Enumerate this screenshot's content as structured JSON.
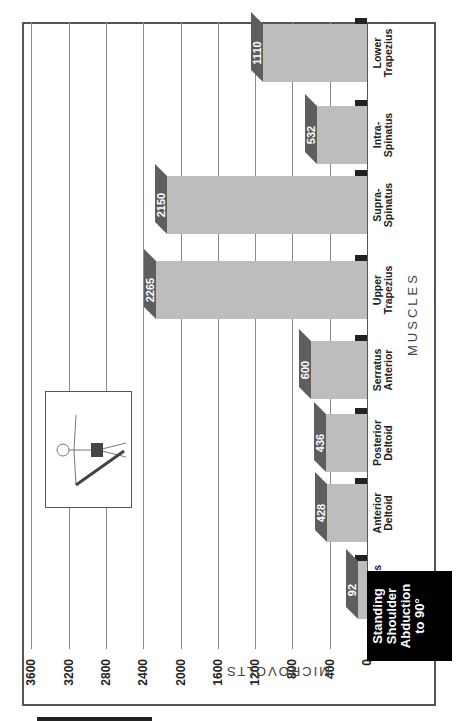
{
  "chart_data": {
    "type": "bar",
    "title": "Standing Shoulder Abduction to 90°",
    "xlabel": "MUSCLES",
    "ylabel": "MICROVOLTS",
    "categories": [
      "Pectoralis Major",
      "Anterior Deltoid",
      "Posterior Deltoid",
      "Serratus Anterior",
      "Upper Trapezius",
      "Supra-Spinatus",
      "Intra-Spinatus",
      "Lower Trapezius"
    ],
    "values": [
      92,
      428,
      436,
      600,
      2265,
      2150,
      532,
      1110
    ],
    "ylim": [
      0,
      3600
    ],
    "yticks": [
      0,
      400,
      800,
      1200,
      1600,
      2000,
      2400,
      2800,
      3200,
      3600
    ],
    "grid": true,
    "style": "3d-bar",
    "orientation": "rotated-90"
  },
  "caption": {
    "lines": [
      "Standing",
      "Shoulder",
      "Abduction",
      "to 90°"
    ]
  },
  "axis": {
    "ylabel": "MICROVOLTS",
    "xlabel": "MUSCLES",
    "ticks": [
      "0",
      "400",
      "800",
      "1200",
      "1600",
      "2000",
      "2400",
      "2800",
      "3200",
      "3600"
    ]
  },
  "bars": [
    {
      "line1": "Pectoralis",
      "line2": "Major",
      "value": "92"
    },
    {
      "line1": "Anterior",
      "line2": "Deltoid",
      "value": "428"
    },
    {
      "line1": "Posterior",
      "line2": "Deltoid",
      "value": "436"
    },
    {
      "line1": "Serratus",
      "line2": "Anterior",
      "value": "600"
    },
    {
      "line1": "Upper",
      "line2": "Trapezius",
      "value": "2265"
    },
    {
      "line1": "Supra-",
      "line2": "Spinatus",
      "value": "2150"
    },
    {
      "line1": "Intra-",
      "line2": "Spinatus",
      "value": "532"
    },
    {
      "line1": "Lower",
      "line2": "Trapezius",
      "value": "1110"
    }
  ],
  "inset": {
    "icon": "figure-with-resistance-band-icon"
  },
  "colors": {
    "bar_front": "#bdbdbd",
    "bar_top": "#5e5e5e",
    "bar_side": "#6b6b6b",
    "bar_floor": "#222222",
    "caption_bg": "#000000"
  }
}
